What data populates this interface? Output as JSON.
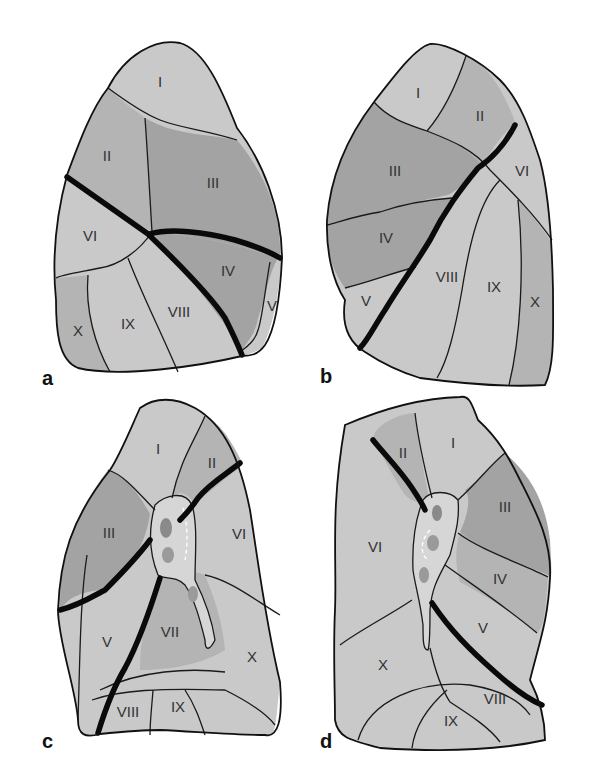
{
  "figure": {
    "colors": {
      "light_segment": "#c9c9c9",
      "medium_segment": "#b4b4b4",
      "dark_segment": "#a3a3a3",
      "fissure": "#0a0a0a",
      "hilum": "#d6d6d6"
    },
    "panels": [
      {
        "id": "a",
        "label": "a",
        "segments": {
          "s1": "I",
          "s2": "II",
          "s3": "III",
          "s4": "IV",
          "s5": "V",
          "s6": "VI",
          "s8": "VIII",
          "s9": "IX",
          "s10": "X"
        }
      },
      {
        "id": "b",
        "label": "b",
        "segments": {
          "s1": "I",
          "s2": "II",
          "s3": "III",
          "s4": "IV",
          "s5": "V",
          "s6": "VI",
          "s8": "VIII",
          "s9": "IX",
          "s10": "X"
        }
      },
      {
        "id": "c",
        "label": "c",
        "segments": {
          "s1": "I",
          "s2": "II",
          "s3": "III",
          "s5": "V",
          "s6": "VI",
          "s7": "VII",
          "s8": "VIII",
          "s9": "IX",
          "s10": "X"
        }
      },
      {
        "id": "d",
        "label": "d",
        "segments": {
          "s1": "I",
          "s2": "II",
          "s3": "III",
          "s4": "IV",
          "s5": "V",
          "s6": "VI",
          "s8": "VIII",
          "s9": "IX",
          "s10": "X"
        }
      }
    ]
  }
}
